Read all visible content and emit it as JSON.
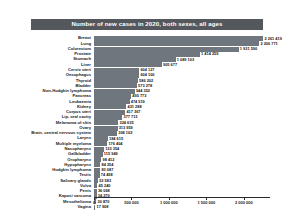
{
  "chart_data": {
    "type": "bar",
    "orientation": "horizontal",
    "title": "Number of new cases in 2020, both sexes, all ages",
    "xlabel": "",
    "ylabel": "",
    "xlim": [
      0,
      2350000
    ],
    "grid": false,
    "legend": "none",
    "tick_labels": [
      "0",
      "500 000",
      "1 000 000",
      "1 500 000",
      "2 000 000"
    ],
    "ticks": [
      0,
      500000,
      1000000,
      1500000,
      2000000
    ],
    "categories": [
      "Breast",
      "Lung",
      "Colorectum",
      "Prostate",
      "Stomach",
      "Liver",
      "Cervix uteri",
      "Oesophagus",
      "Thyroid",
      "Bladder",
      "Non-Hodgkin lymphoma",
      "Pancreas",
      "Leukaemia",
      "Kidney",
      "Corpus uteri",
      "Lip, oral cavity",
      "Melanoma of skin",
      "Ovary",
      "Brain, central nervous system",
      "Larynx",
      "Multiple myeloma",
      "Nasopharynx",
      "Gallbladder",
      "Oropharynx",
      "Hypopharynx",
      "Hodgkin lymphoma",
      "Testis",
      "Salivary glands",
      "Vulva",
      "Penis",
      "Kaposi sarcoma",
      "Mesothelioma",
      "Vagina"
    ],
    "values": [
      2261419,
      2206771,
      1931590,
      1414259,
      1089103,
      905677,
      604127,
      604100,
      586202,
      573278,
      544352,
      495773,
      474519,
      431288,
      417367,
      377713,
      324635,
      313959,
      308102,
      184615,
      176404,
      133354,
      115949,
      98412,
      84254,
      83087,
      74458,
      53583,
      45240,
      36068,
      34270,
      30870,
      17908
    ],
    "value_labels": [
      "2 261 419",
      "2 206 771",
      "1 931 590",
      "1 414 259",
      "1 089 103",
      "905 677",
      "604 127",
      "604 100",
      "586 202",
      "573 278",
      "544 352",
      "495 773",
      "474 519",
      "431 288",
      "417 367",
      "377 713",
      "324 635",
      "313 959",
      "308 102",
      "184 615",
      "176 404",
      "133 354",
      "115 949",
      "98 412",
      "84 254",
      "83 087",
      "74 458",
      "53 583",
      "45 240",
      "36 068",
      "34 270",
      "30 870",
      "17 908"
    ],
    "bar_color": "#6f767d",
    "title_background": "#54585c",
    "title_color": "#ffffff"
  }
}
